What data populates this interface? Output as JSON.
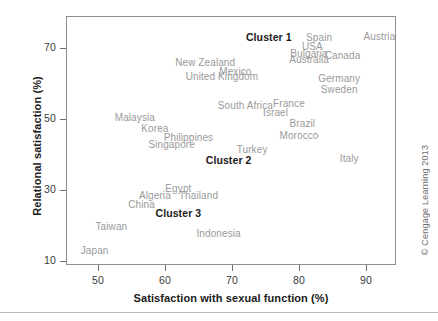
{
  "chart_data": {
    "type": "scatter",
    "title": "",
    "xlabel": "Satisfaction with sexual function (%)",
    "ylabel": "Relational satisfaction (%)",
    "xlim": [
      45,
      95
    ],
    "ylim": [
      9,
      76
    ],
    "xticks": [
      50,
      60,
      70,
      80,
      90
    ],
    "yticks": [
      70,
      50,
      30,
      10
    ],
    "grid": false,
    "legend": null,
    "label_only_points": true,
    "points": [
      {
        "label": "Austria",
        "x": 92.0,
        "y": 73.5
      },
      {
        "label": "Spain",
        "x": 83.0,
        "y": 73.0
      },
      {
        "label": "USA",
        "x": 82.0,
        "y": 70.5
      },
      {
        "label": "Bulgaria",
        "x": 81.5,
        "y": 68.5
      },
      {
        "label": "Australia",
        "x": 81.5,
        "y": 67.0
      },
      {
        "label": "Canada",
        "x": 86.5,
        "y": 68.0
      },
      {
        "label": "New Zealand",
        "x": 66.0,
        "y": 66.0
      },
      {
        "label": "Mexico",
        "x": 70.5,
        "y": 63.5
      },
      {
        "label": "United Kingdom",
        "x": 68.5,
        "y": 62.0
      },
      {
        "label": "Germany",
        "x": 86.0,
        "y": 61.5
      },
      {
        "label": "Sweden",
        "x": 86.0,
        "y": 58.5
      },
      {
        "label": "South Africa",
        "x": 72.0,
        "y": 54.0
      },
      {
        "label": "France",
        "x": 78.5,
        "y": 54.5
      },
      {
        "label": "Israel",
        "x": 76.5,
        "y": 52.0
      },
      {
        "label": "Malaysia",
        "x": 55.5,
        "y": 50.5
      },
      {
        "label": "Korea",
        "x": 58.5,
        "y": 47.5
      },
      {
        "label": "Brazil",
        "x": 80.5,
        "y": 49.0
      },
      {
        "label": "Philippines",
        "x": 63.5,
        "y": 45.0
      },
      {
        "label": "Morocco",
        "x": 80.0,
        "y": 45.5
      },
      {
        "label": "Singapore",
        "x": 61.0,
        "y": 43.0
      },
      {
        "label": "Turkey",
        "x": 73.0,
        "y": 41.5
      },
      {
        "label": "Italy",
        "x": 87.5,
        "y": 39.0
      },
      {
        "label": "Egypt",
        "x": 62.0,
        "y": 30.5
      },
      {
        "label": "Algeria",
        "x": 58.5,
        "y": 28.5
      },
      {
        "label": "Thailand",
        "x": 65.0,
        "y": 28.5
      },
      {
        "label": "China",
        "x": 56.5,
        "y": 26.0
      },
      {
        "label": "Taiwan",
        "x": 52.0,
        "y": 20.0
      },
      {
        "label": "Indonesia",
        "x": 68.0,
        "y": 18.0
      },
      {
        "label": "Japan",
        "x": 49.5,
        "y": 13.0
      }
    ],
    "annotations": [
      {
        "label": "Cluster 1",
        "x": 75.5,
        "y": 73.0
      },
      {
        "label": "Cluster 2",
        "x": 69.5,
        "y": 38.5
      },
      {
        "label": "Cluster 3",
        "x": 62.0,
        "y": 23.5
      }
    ]
  },
  "axes": {
    "x_title": "Satisfaction with sexual function (%)",
    "y_title": "Relational satisfaction (%)",
    "x_tick_labels": [
      "50",
      "60",
      "70",
      "80",
      "90"
    ],
    "y_tick_labels": [
      "70",
      "50",
      "30",
      "10"
    ]
  },
  "credit": {
    "text": "© Cengage Learning 2013"
  },
  "colors": {
    "point_label": "#9a9a9a",
    "cluster_label": "#1a1a1a",
    "frame": "#8e8e8e",
    "tick": "#6f6f6f",
    "background": "#ffffff"
  }
}
